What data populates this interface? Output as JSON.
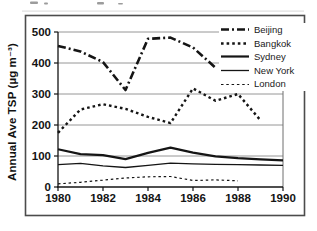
{
  "page": {
    "background": "#ffffff",
    "border_color": "#4c4c4c",
    "artifacts": "faint cropped text remnants above top border (scanned image)"
  },
  "chart_data": {
    "type": "line",
    "title": "",
    "xlabel": "",
    "ylabel": "Annual Ave TSP (µg m⁻³)",
    "x_range": [
      1980,
      1990
    ],
    "ylim": [
      0,
      500
    ],
    "x_ticks": [
      1980,
      1982,
      1984,
      1986,
      1988,
      1990
    ],
    "y_ticks": [
      0,
      100,
      200,
      300,
      400,
      500
    ],
    "grid": "horizontal gridlines at every 100",
    "gridline_color": "#8a8a8a",
    "axis_color": "#141414",
    "line_color": "#151515",
    "legend_position": "top-right, white background, no border",
    "legend_entries": [
      "Beijing",
      "Bangkok",
      "Sydney",
      "New York",
      "London"
    ],
    "series": [
      {
        "name": "Beijing",
        "line_style": "thick dash-dot",
        "width": 2.6,
        "dash": "8 3 2 3",
        "start_year": 1980,
        "values": [
          455,
          437,
          403,
          313,
          478,
          482,
          450,
          385
        ]
      },
      {
        "name": "Bangkok",
        "line_style": "thick dotted",
        "width": 2.4,
        "dash": "2.6 3",
        "start_year": 1980,
        "values": [
          175,
          250,
          267,
          252,
          226,
          206,
          318,
          278,
          300,
          215
        ]
      },
      {
        "name": "Sydney",
        "line_style": "thick solid",
        "width": 2.2,
        "dash": "",
        "start_year": 1980,
        "values": [
          122,
          106,
          103,
          90,
          110,
          127,
          111,
          99,
          93,
          89,
          86
        ]
      },
      {
        "name": "New York",
        "line_style": "thin solid",
        "width": 1.3,
        "dash": "",
        "start_year": 1980,
        "values": [
          72,
          76,
          68,
          63,
          70,
          77,
          75,
          73,
          72,
          71,
          70
        ]
      },
      {
        "name": "London",
        "line_style": "thin dotted",
        "width": 1.2,
        "dash": "2.5 2.8",
        "start_year": 1980,
        "values": [
          10,
          15,
          22,
          29,
          33,
          34,
          21,
          23,
          20
        ]
      }
    ]
  }
}
